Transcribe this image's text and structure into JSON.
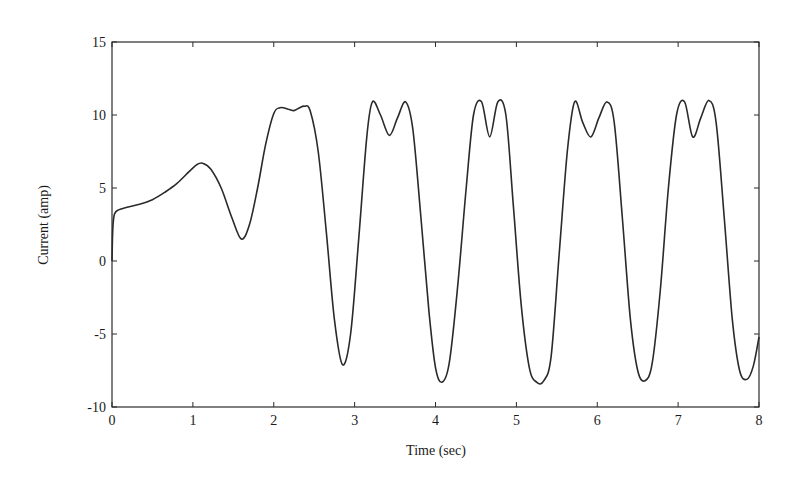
{
  "chart_data": {
    "type": "line",
    "title": "",
    "xlabel": "Time (sec)",
    "ylabel": "Current (amp)",
    "xlim": [
      0,
      8
    ],
    "ylim": [
      -10,
      15
    ],
    "xticks": [
      0,
      1,
      2,
      3,
      4,
      5,
      6,
      7,
      8
    ],
    "yticks": [
      -10,
      -5,
      0,
      5,
      10,
      15
    ],
    "grid": false,
    "legend": null,
    "series": [
      {
        "name": "Current",
        "color": "#2a2a2a",
        "x": [
          0.0,
          0.01,
          0.03,
          0.08,
          0.2,
          0.35,
          0.5,
          0.65,
          0.8,
          0.95,
          1.05,
          1.12,
          1.22,
          1.35,
          1.48,
          1.6,
          1.7,
          1.8,
          1.9,
          2.0,
          2.08,
          2.18,
          2.25,
          2.32,
          2.38,
          2.45,
          2.55,
          2.65,
          2.75,
          2.85,
          2.95,
          3.05,
          3.15,
          3.22,
          3.32,
          3.43,
          3.53,
          3.63,
          3.72,
          3.82,
          3.92,
          4.0,
          4.08,
          4.17,
          4.27,
          4.38,
          4.47,
          4.57,
          4.67,
          4.77,
          4.87,
          4.96,
          5.06,
          5.16,
          5.25,
          5.34,
          5.43,
          5.53,
          5.63,
          5.72,
          5.82,
          5.92,
          6.02,
          6.12,
          6.21,
          6.31,
          6.41,
          6.5,
          6.59,
          6.68,
          6.78,
          6.88,
          6.98,
          7.08,
          7.18,
          7.28,
          7.38,
          7.47,
          7.57,
          7.67,
          7.76,
          7.85,
          7.93,
          8.0
        ],
        "y": [
          0.0,
          2.2,
          3.2,
          3.5,
          3.7,
          3.9,
          4.2,
          4.7,
          5.3,
          6.1,
          6.6,
          6.7,
          6.3,
          5.0,
          3.0,
          1.5,
          2.5,
          5.0,
          8.0,
          10.1,
          10.5,
          10.4,
          10.3,
          10.5,
          10.6,
          10.3,
          7.5,
          2.0,
          -4.0,
          -7.1,
          -5.0,
          1.5,
          8.5,
          10.9,
          10.0,
          8.6,
          9.8,
          10.9,
          9.0,
          3.0,
          -3.5,
          -7.3,
          -8.3,
          -7.0,
          -2.0,
          5.0,
          10.0,
          10.9,
          8.5,
          10.9,
          10.0,
          4.0,
          -3.0,
          -7.3,
          -8.3,
          -8.2,
          -6.5,
          0.5,
          7.5,
          10.9,
          9.5,
          8.5,
          9.8,
          10.9,
          9.5,
          3.0,
          -4.0,
          -7.5,
          -8.2,
          -7.0,
          -2.0,
          5.0,
          10.0,
          10.9,
          8.5,
          9.8,
          11.0,
          9.5,
          3.0,
          -4.0,
          -7.5,
          -8.1,
          -7.2,
          -5.2
        ]
      }
    ]
  }
}
